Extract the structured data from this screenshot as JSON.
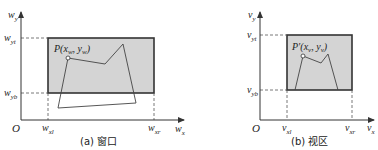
{
  "panels": [
    {
      "id": "window",
      "caption": "(a) 窗口",
      "axis_y": {
        "base": "w",
        "sub": "y"
      },
      "axis_x": {
        "base": "w",
        "sub": "x"
      },
      "origin": "O",
      "ticks_y": [
        {
          "base": "w",
          "sub": "yt"
        },
        {
          "base": "w",
          "sub": "yb"
        }
      ],
      "ticks_x": [
        {
          "base": "w",
          "sub": "xl"
        },
        {
          "base": "w",
          "sub": "xr"
        }
      ],
      "point_label": {
        "main": "P(x",
        "sub1": "w",
        "mid": ", y",
        "sub2": "w",
        "end": ")"
      }
    },
    {
      "id": "viewport",
      "caption": "(b) 视区",
      "axis_y": {
        "base": "v",
        "sub": "y"
      },
      "axis_x": {
        "base": "v",
        "sub": "x"
      },
      "origin": "O",
      "ticks_y": [
        {
          "base": "v",
          "sub": "yt"
        },
        {
          "base": "v",
          "sub": "yb"
        }
      ],
      "ticks_x": [
        {
          "base": "v",
          "sub": "xl"
        },
        {
          "base": "v",
          "sub": "xr"
        }
      ],
      "point_label": {
        "main": "P′(x",
        "sub1": "v",
        "mid": ", y",
        "sub2": "v",
        "end": ")"
      }
    }
  ],
  "colors": {
    "rect_fill": "#d4d4d4",
    "rect_stroke": "#333333",
    "line": "#444444",
    "axis": "#333333"
  }
}
